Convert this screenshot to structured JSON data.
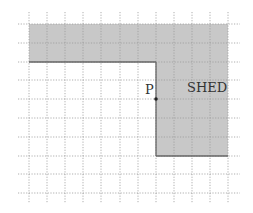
{
  "diagram": {
    "grid": {
      "x_lines": [
        29,
        47,
        65,
        83,
        101,
        120,
        138,
        156,
        174,
        192,
        210,
        228
      ],
      "y_lines": [
        24,
        43,
        62,
        80,
        99,
        118,
        137,
        156,
        174,
        193
      ],
      "x_extent": [
        18,
        240
      ],
      "y_extent": [
        12,
        203
      ],
      "line_color": "#9a9a9a"
    },
    "shed": {
      "label": "SHED",
      "fill": "#c8c8c8",
      "outline": "#666666",
      "polygon": [
        [
          29,
          24
        ],
        [
          228,
          24
        ],
        [
          228,
          156
        ],
        [
          156,
          156
        ],
        [
          156,
          62
        ],
        [
          29,
          62
        ]
      ]
    },
    "point": {
      "label": "P",
      "x": 156,
      "y": 99
    }
  }
}
